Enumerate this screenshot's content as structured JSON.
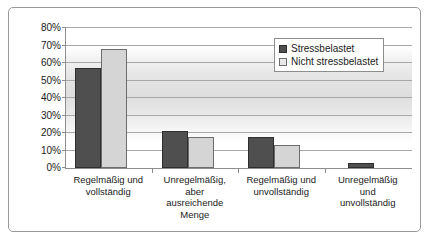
{
  "chart_data": {
    "type": "bar",
    "title": "",
    "xlabel": "",
    "ylabel": "",
    "ylim": [
      0,
      80
    ],
    "ytick_labels": [
      "80%",
      "70%",
      "60%",
      "50%",
      "40%",
      "30%",
      "20%",
      "10%",
      "0%"
    ],
    "ytick_values": [
      80,
      70,
      60,
      50,
      40,
      30,
      20,
      10,
      0
    ],
    "grid": true,
    "legend_position": "upper right",
    "categories": [
      "Regelmäßig und vollständig",
      "Unregelmäßig, aber ausreichende Menge",
      "Regelmäßig und unvollständig",
      "Unregelmäßig und unvollständig"
    ],
    "category_lines": [
      [
        "Regelmäßig und",
        "vollständig"
      ],
      [
        "Unregelmäßig,",
        "aber",
        "ausreichende",
        "Menge"
      ],
      [
        "Regelmäßig und",
        "unvollständig"
      ],
      [
        "Unregelmäßig",
        "und",
        "unvollständig"
      ]
    ],
    "series": [
      {
        "name": "Stressbelastet",
        "color": "#4f4f4f",
        "values": [
          57,
          21,
          18,
          3
        ]
      },
      {
        "name": "Nicht stressbelastet",
        "color": "#d5d5d5",
        "values": [
          68,
          18,
          13,
          null
        ]
      }
    ]
  },
  "legend": {
    "items": [
      {
        "label": "Stressbelastet",
        "swatch": "dark-square-swatch"
      },
      {
        "label": "Nicht stressbelastet",
        "swatch": "light-square-swatch"
      }
    ]
  }
}
